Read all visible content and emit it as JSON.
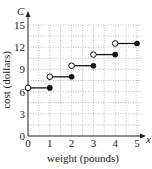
{
  "chart_data": {
    "type": "line",
    "subtype": "step-function",
    "title": "",
    "xlabel": "weight (pounds)",
    "ylabel": "cost (dollars)",
    "x_axis_var": "x",
    "y_axis_var": "C",
    "xlim": [
      0,
      5
    ],
    "ylim": [
      0,
      15
    ],
    "x_ticks": [
      "0",
      "1",
      "2",
      "3",
      "4",
      "5"
    ],
    "y_ticks": [
      "0",
      "3",
      "6",
      "9",
      "12",
      "15"
    ],
    "grid": true,
    "legend": null,
    "segments": [
      {
        "x_start": 0,
        "x_end": 1,
        "y": 6.5,
        "start_open": true,
        "end_closed": true
      },
      {
        "x_start": 1,
        "x_end": 2,
        "y": 8.0,
        "start_open": true,
        "end_closed": true
      },
      {
        "x_start": 2,
        "x_end": 3,
        "y": 9.5,
        "start_open": true,
        "end_closed": true
      },
      {
        "x_start": 3,
        "x_end": 4,
        "y": 11.0,
        "start_open": true,
        "end_closed": true
      },
      {
        "x_start": 4,
        "x_end": 5,
        "y": 12.5,
        "start_open": true,
        "end_closed": true
      }
    ],
    "colors": {
      "line": "#111111",
      "grid": "#999999",
      "axis": "#222222"
    }
  }
}
